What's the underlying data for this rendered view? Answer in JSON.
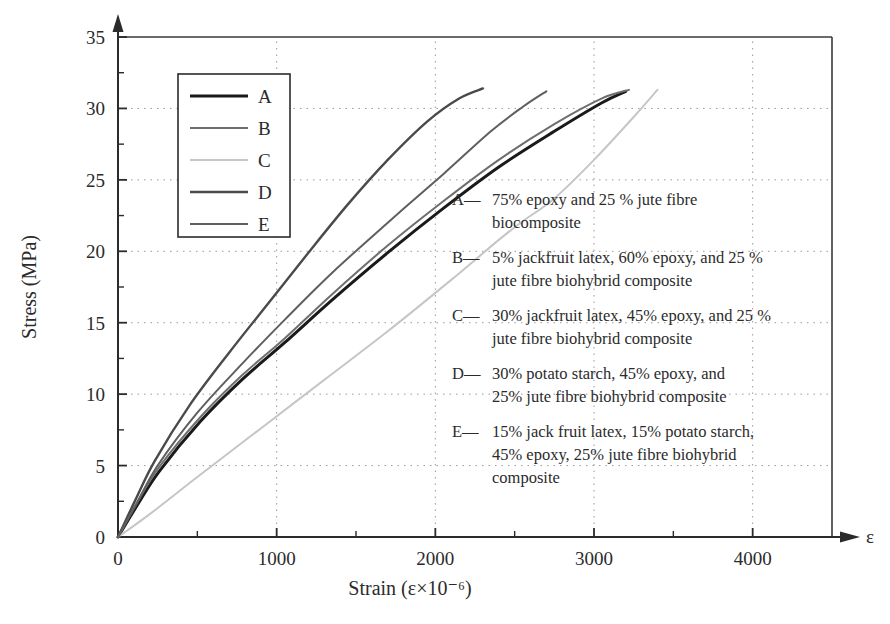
{
  "chart_data": {
    "type": "line",
    "title": "",
    "xlabel": "Strain (ε×10⁻⁶)",
    "ylabel": "Stress (MPa)",
    "x_axis_symbol": "ε",
    "xlim": [
      0,
      4500
    ],
    "ylim": [
      0,
      35
    ],
    "xticks": [
      0,
      1000,
      2000,
      3000,
      4000
    ],
    "xtick_labels": [
      "0",
      "1000",
      "2000",
      "3000",
      "4000"
    ],
    "x_minor_ticks": [
      500,
      1500,
      2500,
      3500
    ],
    "yticks": [
      0,
      5,
      10,
      15,
      20,
      25,
      30,
      35
    ],
    "ytick_labels": [
      "0",
      "5",
      "10",
      "15",
      "20",
      "25",
      "30",
      "35"
    ],
    "y_minor_ticks": [
      2.5,
      7.5,
      12.5,
      17.5,
      22.5,
      27.5,
      32.5
    ],
    "grid": "dotted",
    "grid_color": "#9a9a9a",
    "legend_position": "upper-left-inside",
    "series": [
      {
        "name": "A",
        "color": "#1a1a1a",
        "x": [
          0,
          120,
          260,
          520,
          780,
          1050,
          1350,
          1700,
          2050,
          2400,
          2750,
          3050,
          3200
        ],
        "y": [
          0,
          2.2,
          4.6,
          8.1,
          11.0,
          13.6,
          16.6,
          19.9,
          23.0,
          25.9,
          28.4,
          30.4,
          31.2
        ]
      },
      {
        "name": "B",
        "color": "#6e6e6e",
        "x": [
          0,
          120,
          260,
          520,
          780,
          1050,
          1350,
          1700,
          2050,
          2400,
          2750,
          3050,
          3220
        ],
        "y": [
          0,
          2.4,
          4.9,
          8.4,
          11.3,
          13.9,
          17.0,
          20.4,
          23.5,
          26.4,
          28.9,
          30.7,
          31.3
        ]
      },
      {
        "name": "C",
        "color": "#c6c6c6",
        "x": [
          0,
          200,
          500,
          900,
          1300,
          1700,
          2100,
          2400,
          2550,
          2750,
          3000,
          3250,
          3400
        ],
        "y": [
          0,
          1.6,
          4.2,
          7.6,
          11.0,
          14.4,
          18.0,
          20.8,
          22.1,
          23.7,
          26.4,
          29.4,
          31.3
        ]
      },
      {
        "name": "D",
        "color": "#4a4a4a",
        "x": [
          0,
          110,
          230,
          450,
          700,
          950,
          1200,
          1450,
          1700,
          1950,
          2150,
          2300
        ],
        "y": [
          0,
          2.6,
          5.3,
          9.2,
          12.9,
          16.4,
          19.9,
          23.3,
          26.4,
          29.1,
          30.7,
          31.4
        ]
      },
      {
        "name": "E",
        "color": "#5f5f5f",
        "x": [
          0,
          120,
          250,
          500,
          780,
          1050,
          1350,
          1700,
          2050,
          2350,
          2550,
          2700
        ],
        "y": [
          0,
          2.4,
          5.0,
          8.7,
          12.1,
          15.2,
          18.5,
          22.0,
          25.4,
          28.4,
          30.1,
          31.2
        ]
      }
    ],
    "annotations": [
      {
        "key": "A",
        "prefix": "A—",
        "lines": [
          "75% epoxy and 25 % jute fibre",
          "biocomposite"
        ]
      },
      {
        "key": "B",
        "prefix": "B—",
        "lines": [
          "5% jackfruit latex, 60% epoxy, and 25 %",
          "jute fibre biohybrid composite"
        ]
      },
      {
        "key": "C",
        "prefix": "C—",
        "lines": [
          "30% jackfruit latex, 45% epoxy, and 25 %",
          "jute fibre biohybrid composite"
        ]
      },
      {
        "key": "D",
        "prefix": "D—",
        "lines": [
          "30% potato starch, 45% epoxy, and",
          "25% jute fibre biohybrid composite"
        ]
      },
      {
        "key": "E",
        "prefix": "E—",
        "lines": [
          "15% jack fruit latex, 15% potato starch,",
          "45% epoxy, 25% jute fibre biohybrid",
          "composite"
        ]
      }
    ],
    "legend_entries": [
      {
        "label": "A",
        "color": "#1a1a1a",
        "width": 3.0
      },
      {
        "label": "B",
        "color": "#6e6e6e",
        "width": 2.0
      },
      {
        "label": "C",
        "color": "#c6c6c6",
        "width": 2.0
      },
      {
        "label": "D",
        "color": "#4a4a4a",
        "width": 2.6
      },
      {
        "label": "E",
        "color": "#5f5f5f",
        "width": 2.0
      }
    ]
  }
}
